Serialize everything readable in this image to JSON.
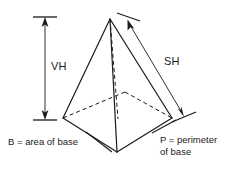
{
  "figure": {
    "stroke_color": "#1a1a1a",
    "background_color": "#ffffff",
    "labels": {
      "vertical_height": "VH",
      "slant_height": "SH",
      "base_area": "B = area of base",
      "base_perimeter_line1": "P = perimeter",
      "base_perimeter_line2": "of base"
    },
    "geometry": {
      "apex": [
        110,
        19
      ],
      "base_left": [
        63,
        118
      ],
      "base_front": [
        117,
        152
      ],
      "base_right": [
        172,
        118
      ],
      "base_back": [
        125,
        92
      ],
      "base_center": [
        118,
        119
      ]
    },
    "dimensions": {
      "vertical_height_line": {
        "x": 45,
        "y_top": 19,
        "y_bottom": 118,
        "arrowheads": "both"
      },
      "slant_height_line": {
        "from": [
          128,
          16
        ],
        "to": [
          186,
          116
        ],
        "arrowheads": "both"
      }
    }
  }
}
